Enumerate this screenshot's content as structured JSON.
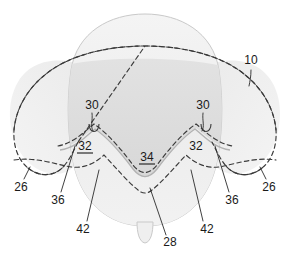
{
  "figure": {
    "type": "patent-line-drawing",
    "title": "",
    "background_color": "#ffffff",
    "palette": {
      "outline_solid": "#b9b9b9",
      "outline_dashed": "#3a3a3a",
      "fill_light": "#efefef",
      "fill_mid": "#e6e6e6",
      "fill_dark": "#dcdcdc",
      "fill_lobe": "#f0f0f0",
      "label_color": "#1a1a1a",
      "leader_color": "#2b2b2b"
    },
    "shapes": [
      {
        "name": "main-body",
        "description": "central dome shaped body with rounded bottom",
        "fill": "#efefef",
        "stroke": "#c2c2c2"
      },
      {
        "name": "left-lobe",
        "description": "dashed wing shaped lobe on left side",
        "fill": "#f0f0f0",
        "stroke": "#3a3a3a",
        "stroke_style": "dashed"
      },
      {
        "name": "right-lobe",
        "description": "dashed wing shaped lobe on right side",
        "fill": "#f0f0f0",
        "stroke": "#3a3a3a",
        "stroke_style": "dashed"
      },
      {
        "name": "shaded-shield-region",
        "description": "darker gray shield region bounded above by dashed arc and below by valley curve",
        "fill": "#dcdcdc"
      },
      {
        "name": "upper-dashed-arc",
        "description": "dashed arc crossing the top of the dome",
        "stroke": "#3a3a3a",
        "stroke_style": "dashed"
      },
      {
        "name": "valley-curve-solid",
        "description": "W shaped solid gray valley curve across middle",
        "stroke": "#b0b0b0"
      },
      {
        "name": "valley-curve-dashed",
        "description": "W shaped dashed valley curve across middle",
        "stroke": "#3a3a3a",
        "stroke_style": "dashed"
      },
      {
        "name": "outer-dashed-boundary",
        "description": "large dashed boundary enclosing body and both lobes",
        "stroke": "#3a3a3a",
        "stroke_style": "dashed"
      },
      {
        "name": "bottom-nub",
        "description": "small protrusion at bottom center of body",
        "fill": "#efefef",
        "stroke": "#c2c2c2"
      },
      {
        "name": "left-notch-hook",
        "description": "small U shaped notch on left valley ridge",
        "stroke": "#3a3a3a"
      },
      {
        "name": "right-notch-hook",
        "description": "small U shaped notch on right valley ridge",
        "stroke": "#3a3a3a"
      }
    ],
    "callouts": [
      {
        "id": "c10",
        "text": "10",
        "underlined": false,
        "x": 251,
        "y": 64,
        "leader": "M 251 70 L 251 84"
      },
      {
        "id": "c30L",
        "text": "30",
        "underlined": false,
        "x": 92,
        "y": 109,
        "leader": "M 92 113 C 92 122, 90 127, 93 133"
      },
      {
        "id": "c30R",
        "text": "30",
        "underlined": false,
        "x": 203,
        "y": 109,
        "leader": "M 203 113 C 203 122, 205 127, 202 133"
      },
      {
        "id": "c32L",
        "text": "32",
        "underlined": true,
        "x": 85,
        "y": 150,
        "leader": ""
      },
      {
        "id": "c32R",
        "text": "32",
        "underlined": false,
        "x": 196,
        "y": 150,
        "leader": ""
      },
      {
        "id": "c34",
        "text": "34",
        "underlined": true,
        "x": 147,
        "y": 161,
        "leader": ""
      },
      {
        "id": "c26L",
        "text": "26",
        "underlined": false,
        "x": 21,
        "y": 187,
        "leader": "M 24 178 L 29 168"
      },
      {
        "id": "c26R",
        "text": "26",
        "underlined": false,
        "x": 268,
        "y": 187,
        "leader": "M 265 178 L 260 168"
      },
      {
        "id": "c36L",
        "text": "36",
        "underlined": false,
        "x": 59,
        "y": 200,
        "leader": "M 62 192 L 74 145"
      },
      {
        "id": "c36R",
        "text": "36",
        "underlined": false,
        "x": 231,
        "y": 200,
        "leader": "M 228 192 L 216 145"
      },
      {
        "id": "c42L",
        "text": "42",
        "underlined": false,
        "x": 84,
        "y": 229,
        "leader": "M 88 221 L 99 169"
      },
      {
        "id": "c42R",
        "text": "42",
        "underlined": false,
        "x": 207,
        "y": 229,
        "leader": "M 203 221 L 192 169"
      },
      {
        "id": "c28",
        "text": "28",
        "underlined": false,
        "x": 169,
        "y": 243,
        "leader": "M 166 235 L 150 187"
      }
    ]
  }
}
